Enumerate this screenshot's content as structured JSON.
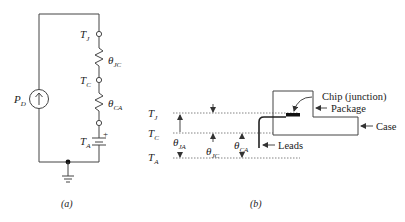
{
  "panel_a": {
    "caption": "(a)",
    "source": {
      "label": "P",
      "sub": "D"
    },
    "nodes": [
      {
        "label": "T",
        "sub": "J"
      },
      {
        "label": "T",
        "sub": "C"
      },
      {
        "label": "T",
        "sub": "A"
      }
    ],
    "resistors": [
      {
        "label": "θ",
        "sub": "JC"
      },
      {
        "label": "θ",
        "sub": "CA"
      }
    ],
    "battery_polarity": "+"
  },
  "panel_b": {
    "caption": "(b)",
    "levels": [
      {
        "label": "T",
        "sub": "J"
      },
      {
        "label": "T",
        "sub": "C"
      },
      {
        "label": "T",
        "sub": "A"
      }
    ],
    "resistances": [
      {
        "label": "θ",
        "sub": "JA"
      },
      {
        "label": "θ",
        "sub": "JC"
      },
      {
        "label": "θ",
        "sub": "CA"
      }
    ],
    "callouts": {
      "chip": "Chip (junction)",
      "package": "Package",
      "case": "Case",
      "leads": "Leads"
    }
  },
  "colors": {
    "line": "#444444",
    "chip": "#111111",
    "dotted": "#666666"
  }
}
